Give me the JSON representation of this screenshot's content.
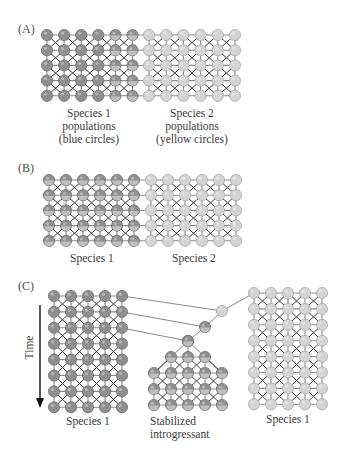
{
  "figure": {
    "colors": {
      "species1": "#8f8f8f",
      "species1_stroke": "#6e6e6e",
      "species2": "#d4d4d4",
      "species2_stroke": "#a9a9a9",
      "introgressed_inner": "#c9c9c9",
      "edge": "#8a8a8a",
      "cross": "#3c3c3c",
      "text": "#3a3a3a"
    },
    "panels": [
      {
        "id": "A",
        "label": "(A)",
        "label_pos": [
          18,
          33
        ],
        "grids": [
          {
            "name": "species1-grid",
            "x0": 47,
            "y0": 35,
            "dx": 17.1,
            "dy": 15.2,
            "cols": 6,
            "rows": 5,
            "color": "species1",
            "introgressed_cols": [
              4,
              5
            ]
          },
          {
            "name": "species2-grid",
            "x0": 149,
            "y0": 35,
            "dx": 17.2,
            "dy": 15.2,
            "cols": 6,
            "rows": 5,
            "color": "species2",
            "introgressed_cols": []
          }
        ],
        "bridges": [
          {
            "from_x": 132,
            "to_x": 149,
            "rows": 5,
            "y0": 35,
            "dy": 15.2
          }
        ],
        "captions": [
          {
            "lines": [
              "Species 1",
              "populations",
              "(blue circles)"
            ],
            "x": 89,
            "y": 117
          },
          {
            "lines": [
              "Species 2",
              "populations",
              "(yellow circles)"
            ],
            "x": 192,
            "y": 117
          }
        ]
      },
      {
        "id": "B",
        "label": "(B)",
        "label_pos": [
          18,
          172
        ],
        "grids": [
          {
            "name": "species1-grid",
            "x0": 49,
            "y0": 180,
            "dx": 17.0,
            "dy": 15.2,
            "cols": 6,
            "rows": 5,
            "color": "species1",
            "introgressed_cols": [
              0,
              1,
              2,
              3,
              4,
              5
            ]
          },
          {
            "name": "species2-grid",
            "x0": 151,
            "y0": 180,
            "dx": 17.0,
            "dy": 15.2,
            "cols": 6,
            "rows": 5,
            "color": "species2",
            "introgressed_cols": []
          }
        ],
        "bridges": [
          {
            "from_x": 134,
            "to_x": 151,
            "rows": 5,
            "y0": 180,
            "dy": 15.2
          }
        ],
        "captions": [
          {
            "lines": [
              "Species 1"
            ],
            "x": 92,
            "y": 262
          },
          {
            "lines": [
              "Species 2"
            ],
            "x": 194,
            "y": 262
          }
        ]
      },
      {
        "id": "C",
        "label": "(C)",
        "label_pos": [
          18,
          290
        ],
        "time_label": "Time",
        "time_arrow": {
          "x": 40,
          "y1": 305,
          "y2": 406
        },
        "grids": [
          {
            "name": "species1-left-grid",
            "x0": 54,
            "y0": 296,
            "dx": 17.0,
            "dy": 15.9,
            "cols": 5,
            "rows": 8,
            "color": "species1",
            "introgressed_cols": []
          },
          {
            "name": "species1-right-grid",
            "x0": 254,
            "y0": 293,
            "dx": 17.0,
            "dy": 15.9,
            "cols": 5,
            "rows": 8,
            "color": "species2",
            "introgressed_cols": []
          }
        ],
        "chain": {
          "nodes": [
            [
              222,
              311
            ],
            [
              205,
              327
            ],
            [
              188,
              341
            ]
          ],
          "from_left": [
            [
              122,
              296
            ],
            [
              122,
              312
            ],
            [
              122,
              328
            ]
          ],
          "to_right": [
            254,
            293
          ]
        },
        "introgressant": {
          "apex": [
            188,
            341
          ],
          "row3": {
            "y": 357,
            "xs": [
              171,
              188,
              205
            ]
          },
          "rows5": {
            "ys": [
              373,
              389,
              405
            ],
            "xs": [
              154,
              171,
              188,
              205,
              222
            ]
          }
        },
        "captions": [
          {
            "lines": [
              "Species 1"
            ],
            "x": 88,
            "y": 425
          },
          {
            "lines": [
              "Stabilized",
              "introgressant"
            ],
            "x": 150,
            "y": 425,
            "anchor": "start"
          },
          {
            "lines": [
              "Species 1"
            ],
            "x": 288,
            "y": 423
          }
        ]
      }
    ]
  }
}
